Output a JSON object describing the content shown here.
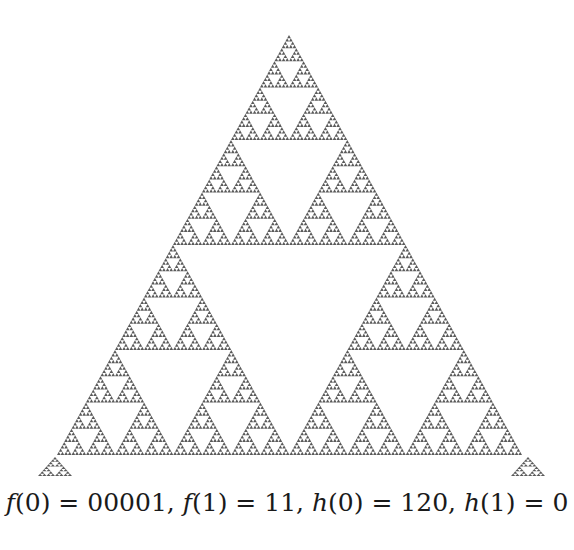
{
  "figure": {
    "type": "sierpinski-triangle",
    "fill_color": "#5a5a5a",
    "hole_color": "#ffffff",
    "main_triangle": {
      "apex": [
        289,
        35
      ],
      "left": [
        57,
        455
      ],
      "right": [
        522,
        455
      ],
      "depth": 7
    },
    "corner_triangles": [
      {
        "apex": [
          55,
          457
        ],
        "left": [
          38,
          476
        ],
        "right": [
          72,
          476
        ],
        "depth": 3
      },
      {
        "apex": [
          528,
          457
        ],
        "left": [
          511,
          476
        ],
        "right": [
          545,
          476
        ],
        "depth": 3
      }
    ]
  },
  "caption": {
    "text": "f(0) = 00001, f(1) = 11, h(0) = 120, h(1) = 0",
    "parts": [
      {
        "fn": "f",
        "arg": "0",
        "value": "00001"
      },
      {
        "fn": "f",
        "arg": "1",
        "value": "11"
      },
      {
        "fn": "h",
        "arg": "0",
        "value": "120"
      },
      {
        "fn": "h",
        "arg": "1",
        "value": "0"
      }
    ]
  }
}
